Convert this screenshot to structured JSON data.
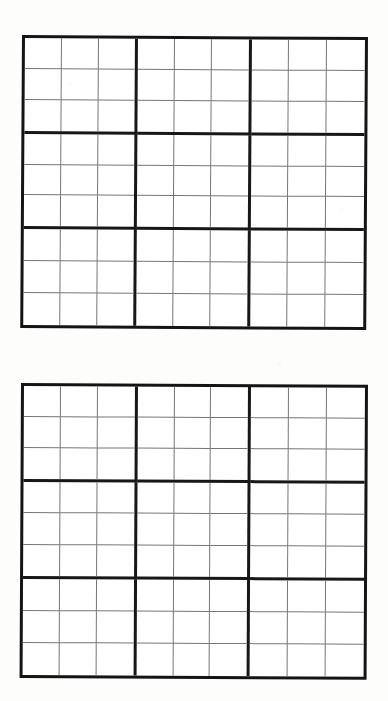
{
  "page": {
    "background_color": "#fdfdfc",
    "width": 388,
    "height": 701,
    "sheet_description": "Scanned worksheet page containing two blank 9x9 sudoku grids"
  },
  "style": {
    "thin_line_color": "#757575",
    "thick_line_color": "#171717",
    "cell_background": "#ffffff",
    "digit_color": "#1a1a1a"
  },
  "puzzles": [
    {
      "id": "puzzle-1",
      "label": "Sudoku grid 1",
      "position": "top",
      "size": "9x9",
      "box_size": "3x3",
      "filled_count": 0,
      "grid": [
        [
          "",
          "",
          "",
          "",
          "",
          "",
          "",
          "",
          ""
        ],
        [
          "",
          "",
          "",
          "",
          "",
          "",
          "",
          "",
          ""
        ],
        [
          "",
          "",
          "",
          "",
          "",
          "",
          "",
          "",
          ""
        ],
        [
          "",
          "",
          "",
          "",
          "",
          "",
          "",
          "",
          ""
        ],
        [
          "",
          "",
          "",
          "",
          "",
          "",
          "",
          "",
          ""
        ],
        [
          "",
          "",
          "",
          "",
          "",
          "",
          "",
          "",
          ""
        ],
        [
          "",
          "",
          "",
          "",
          "",
          "",
          "",
          "",
          ""
        ],
        [
          "",
          "",
          "",
          "",
          "",
          "",
          "",
          "",
          ""
        ],
        [
          "",
          "",
          "",
          "",
          "",
          "",
          "",
          "",
          ""
        ]
      ]
    },
    {
      "id": "puzzle-2",
      "label": "Sudoku grid 2",
      "position": "bottom",
      "size": "9x9",
      "box_size": "3x3",
      "filled_count": 0,
      "grid": [
        [
          "",
          "",
          "",
          "",
          "",
          "",
          "",
          "",
          ""
        ],
        [
          "",
          "",
          "",
          "",
          "",
          "",
          "",
          "",
          ""
        ],
        [
          "",
          "",
          "",
          "",
          "",
          "",
          "",
          "",
          ""
        ],
        [
          "",
          "",
          "",
          "",
          "",
          "",
          "",
          "",
          ""
        ],
        [
          "",
          "",
          "",
          "",
          "",
          "",
          "",
          "",
          ""
        ],
        [
          "",
          "",
          "",
          "",
          "",
          "",
          "",
          "",
          ""
        ],
        [
          "",
          "",
          "",
          "",
          "",
          "",
          "",
          "",
          ""
        ],
        [
          "",
          "",
          "",
          "",
          "",
          "",
          "",
          "",
          ""
        ],
        [
          "",
          "",
          "",
          "",
          "",
          "",
          "",
          "",
          ""
        ]
      ]
    }
  ]
}
